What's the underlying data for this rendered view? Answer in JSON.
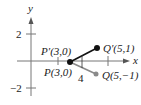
{
  "axes": {
    "x_label": "x",
    "y_label": "y",
    "y_tick_labels": [
      "2",
      "−2"
    ]
  },
  "points": {
    "P_prime": {
      "label": "P′(3,0)"
    },
    "P": {
      "label": "P(3,0)"
    },
    "Q_prime": {
      "label": "Q′(5,1)"
    },
    "Q": {
      "label": "Q(5,−1)"
    }
  },
  "annotation": {
    "length_label": "4"
  },
  "colors": {
    "black": "#111111",
    "gray": "#8a8a8a"
  }
}
